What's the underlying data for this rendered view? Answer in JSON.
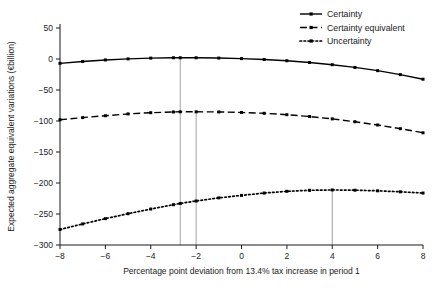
{
  "chart_data": {
    "type": "line",
    "title": "",
    "xlabel": "Percentage point deviation from 13.4% tax increase in period 1",
    "ylabel": "Expected aggregate equivalent variations (€billion)",
    "xlim": [
      -8,
      8
    ],
    "ylim": [
      -300,
      50
    ],
    "xticks": [
      -8,
      -6,
      -4,
      -2,
      0,
      2,
      4,
      6,
      8
    ],
    "xtick_labels": [
      "−8",
      "−6",
      "−4",
      "−2",
      "0",
      "2",
      "4",
      "6",
      "8"
    ],
    "yticks": [
      50,
      0,
      -50,
      -100,
      -150,
      -200,
      -250,
      -300
    ],
    "ytick_labels": [
      "50",
      "0",
      "−50",
      "−100",
      "−150",
      "−200",
      "−250",
      "−300"
    ],
    "grid": false,
    "legend_position": "top-right",
    "x": [
      -8,
      -7,
      -6,
      -5,
      -4,
      -3,
      -2.7,
      -2,
      -1,
      0,
      1,
      2,
      3,
      4,
      5,
      6,
      7,
      8
    ],
    "series": [
      {
        "name": "Certainty",
        "style": "solid",
        "color": "#000000",
        "marker": "square",
        "values": [
          -7,
          -4,
          -1.5,
          0.2,
          1.4,
          2.0,
          2.0,
          2.0,
          1.5,
          0.6,
          -0.8,
          -2.8,
          -5.6,
          -9.2,
          -13.6,
          -18.8,
          -25.2,
          -32.6
        ]
      },
      {
        "name": "Certainty equivalent",
        "style": "dashed",
        "color": "#000000",
        "marker": "square",
        "values": [
          -98.0,
          -94.5,
          -91.5,
          -88.6,
          -86.6,
          -85.4,
          -85.2,
          -85.2,
          -85.4,
          -86.2,
          -87.6,
          -89.8,
          -92.8,
          -96.6,
          -101.2,
          -106.4,
          -112.4,
          -119.0
        ]
      },
      {
        "name": "Uncertainty",
        "style": "dotted",
        "color": "#000000",
        "marker": "square",
        "values": [
          -275.0,
          -266.0,
          -257.5,
          -249.5,
          -242.0,
          -235.0,
          -233.0,
          -229.0,
          -224.0,
          -220.0,
          -216.2,
          -213.4,
          -211.8,
          -211.2,
          -211.6,
          -212.6,
          -214.2,
          -216.2
        ]
      }
    ],
    "reference_lines": [
      {
        "name": "certainty-optimum",
        "x": -2.7,
        "y_top": 2.0,
        "y_bottom": -300
      },
      {
        "name": "certainty-equivalent-optimum",
        "x": -2.0,
        "y_top": -85.2,
        "y_bottom": -300
      },
      {
        "name": "uncertainty-optimum",
        "x": 4.0,
        "y_top": -211.2,
        "y_bottom": -300
      }
    ]
  },
  "legend": {
    "items": [
      {
        "label": "Certainty"
      },
      {
        "label": "Certainty equivalent"
      },
      {
        "label": "Uncertainty"
      }
    ]
  }
}
